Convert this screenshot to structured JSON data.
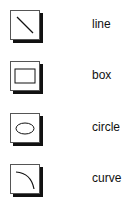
{
  "tools": [
    {
      "id": "line",
      "label": "line",
      "icon": "line-icon"
    },
    {
      "id": "box",
      "label": "box",
      "icon": "box-icon"
    },
    {
      "id": "circle",
      "label": "circle",
      "icon": "circle-icon"
    },
    {
      "id": "curve",
      "label": "curve",
      "icon": "curve-icon"
    }
  ]
}
